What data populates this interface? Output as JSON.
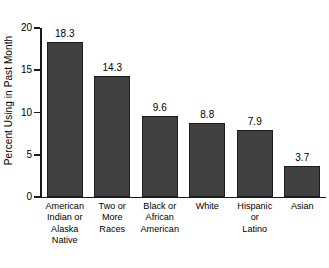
{
  "chart_data": {
    "type": "bar",
    "title": "",
    "xlabel": "",
    "ylabel": "Percent Using in Past Month",
    "ylim": [
      0,
      20
    ],
    "yticks": [
      0,
      5,
      10,
      15,
      20
    ],
    "grid": false,
    "legend": false,
    "categories": [
      "American Indian or Alaska Native",
      "Two or More Races",
      "Black or African American",
      "White",
      "Hispanic or Latino",
      "Asian"
    ],
    "category_lines": [
      [
        "American",
        "Indian or",
        "Alaska",
        "Native"
      ],
      [
        "Two or",
        "More",
        "Races"
      ],
      [
        "Black or",
        "African",
        "American"
      ],
      [
        "White"
      ],
      [
        "Hispanic",
        "or",
        "Latino"
      ],
      [
        "Asian"
      ]
    ],
    "values": [
      18.3,
      14.3,
      9.6,
      8.8,
      7.9,
      3.7
    ],
    "value_labels": [
      "18.3",
      "14.3",
      "9.6",
      "8.8",
      "7.9",
      "3.7"
    ],
    "bar_color": "#414141",
    "bar_edge_color": "#1c1c1c",
    "axis_color": "#1a1a1a",
    "background_color": "#ffffff"
  },
  "axis": {
    "tick_labels": [
      "20",
      "15",
      "10",
      "5",
      "0"
    ]
  }
}
